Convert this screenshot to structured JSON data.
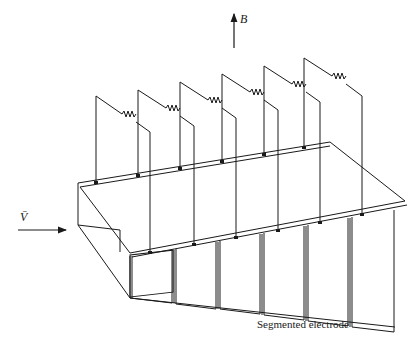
{
  "diagram": {
    "type": "MHD generator channel with segmented electrodes",
    "labels": {
      "magnetic_field": "B",
      "velocity": "V̄",
      "caption": "Segmented electrode"
    },
    "electrode_pairs": 6,
    "colors": {
      "line": "#1a1a1a",
      "background": "#ffffff"
    }
  }
}
